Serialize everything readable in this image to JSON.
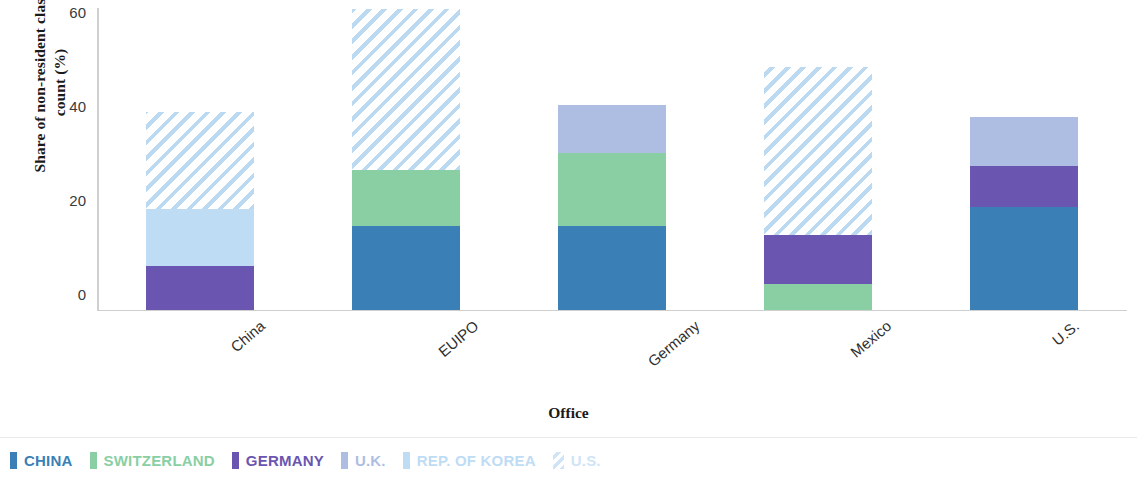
{
  "axes": {
    "ylabel": "Share of non-resident class count (%)",
    "ylabel_line1": "Share of non-resident class",
    "ylabel_line2": "count (%)",
    "xlabel": "Office",
    "yticks": [
      "0",
      "20",
      "40",
      "60"
    ]
  },
  "legend": {
    "items": [
      {
        "label": "CHINA",
        "color": "#3A7FB5",
        "pattern": "solid"
      },
      {
        "label": "SWITZERLAND",
        "color": "#8ACFA3",
        "pattern": "solid"
      },
      {
        "label": "GERMANY",
        "color": "#6A55B0",
        "pattern": "solid"
      },
      {
        "label": "U.K.",
        "color": "#AEBEE2",
        "pattern": "solid"
      },
      {
        "label": "REP. OF KOREA",
        "color": "#BFDCF5",
        "pattern": "solid"
      },
      {
        "label": "U.S.",
        "color": "#CFE4F7",
        "pattern": "hatch"
      }
    ]
  },
  "chart_data": {
    "type": "bar",
    "title": "",
    "subtitle": "",
    "stacked": true,
    "xlabel": "Office",
    "ylabel": "Share of non-resident class count (%)",
    "ylim": [
      0,
      63.9
    ],
    "yticks": [
      0,
      20,
      40,
      60
    ],
    "grid": false,
    "legend_position": "bottom-left",
    "categories": [
      "China",
      "EUIPO",
      "Germany",
      "Mexico",
      "U.S."
    ],
    "series": [
      {
        "name": "CHINA",
        "color": "#3A7FB5",
        "pattern": "solid",
        "values": [
          0,
          17.7,
          17.7,
          0,
          21.8
        ]
      },
      {
        "name": "SWITZERLAND",
        "color": "#8ACFA3",
        "pattern": "solid",
        "values": [
          0,
          11.9,
          15.5,
          5.4,
          0
        ]
      },
      {
        "name": "GERMANY",
        "color": "#6A55B0",
        "pattern": "solid",
        "values": [
          9.3,
          0,
          0,
          10.4,
          8.8
        ]
      },
      {
        "name": "U.K.",
        "color": "#AEBEE2",
        "pattern": "solid",
        "values": [
          0,
          0,
          10.2,
          0,
          10.4
        ]
      },
      {
        "name": "REP. OF KOREA",
        "color": "#BFDCF5",
        "pattern": "solid",
        "values": [
          12.1,
          0,
          0,
          0,
          0
        ]
      },
      {
        "name": "U.S.",
        "color": "#CFE4F7",
        "pattern": "hatch",
        "values": [
          20.5,
          34.3,
          0,
          35.8,
          0
        ]
      }
    ],
    "totals": [
      41.9,
      63.9,
      43.4,
      51.6,
      41.0
    ]
  }
}
